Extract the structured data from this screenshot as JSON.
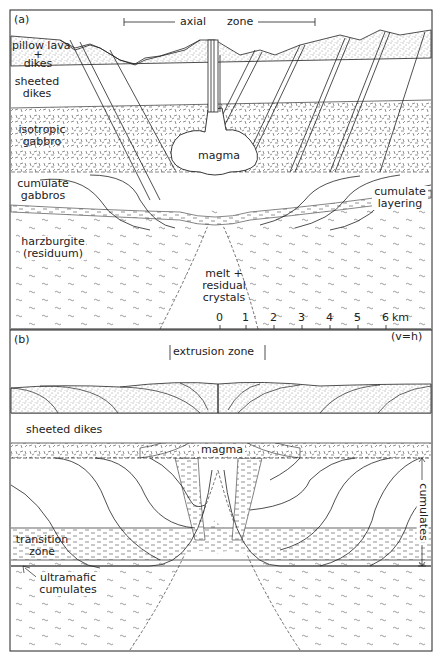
{
  "figure": {
    "panel_a": {
      "label": "(a)",
      "zone_label_left": "axial",
      "zone_label_right": "zone",
      "layers": {
        "pillow_lava": [
          "pillow lava",
          "+",
          "dikes"
        ],
        "sheeted_dikes": [
          "sheeted",
          "dikes"
        ],
        "isotropic_gabbro": [
          "isotropic",
          "gabbro"
        ],
        "cumulate_gabbros": [
          "cumulate",
          "gabbros"
        ],
        "harzburgite": [
          "harzburgite",
          "(residuum)"
        ],
        "magma": "magma",
        "melt": [
          "melt +",
          "residual",
          "crystals"
        ],
        "cumulate_layering": [
          "cumulate",
          "layering"
        ]
      },
      "scale": {
        "ticks": [
          "0",
          "1",
          "2",
          "3",
          "4",
          "5",
          "6"
        ],
        "unit": "km",
        "ratio": "(v=h)"
      }
    },
    "panel_b": {
      "label": "(b)",
      "zone_label": "extrusion  zone",
      "layers": {
        "sheeted_dikes": "sheeted dikes",
        "magma": "magma",
        "transition_zone": [
          "transition",
          "zone"
        ],
        "ultramafic_cumulates": [
          "ultramafic",
          "cumulates"
        ],
        "cumulates_bracket": "cumulates"
      }
    }
  },
  "colors": {
    "ink": "#222222",
    "paper": "#ffffff"
  }
}
